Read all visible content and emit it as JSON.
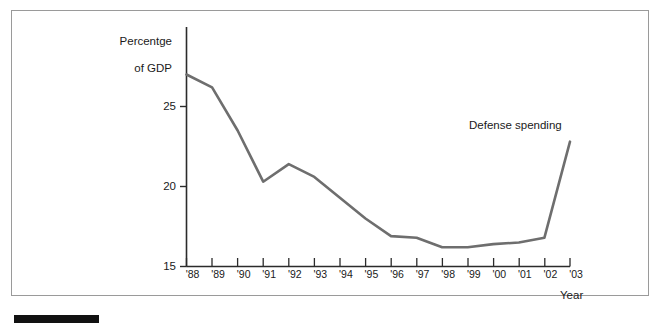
{
  "figure": {
    "background_color": "#ffffff",
    "frame_color": "#9a9a9a",
    "caption_bar_color": "#111111",
    "line_color": "#6e6e6e",
    "axis_color": "#2b2b2b"
  },
  "chart_data": {
    "type": "line",
    "title": "",
    "subtitle": "",
    "xlabel": "Year",
    "ylabel": "Percentge\nof GDP",
    "ylabel_line1": "Percentge",
    "ylabel_line2": "of GDP",
    "categories": [
      "'88",
      "'89",
      "'90",
      "'91",
      "'92",
      "'93",
      "'94",
      "'95",
      "'96",
      "'97",
      "'98",
      "'99",
      "'00",
      "'01",
      "'02",
      "'03"
    ],
    "x": [
      1988,
      1989,
      1990,
      1991,
      1992,
      1993,
      1994,
      1995,
      1996,
      1997,
      1998,
      1999,
      2000,
      2001,
      2002,
      2003
    ],
    "series": [
      {
        "name": "Defense spending",
        "values": [
          27.0,
          26.2,
          23.5,
          20.3,
          21.4,
          20.6,
          19.3,
          18.0,
          16.9,
          16.8,
          16.2,
          16.2,
          16.4,
          16.5,
          16.8,
          22.8
        ]
      }
    ],
    "ylim": [
      15,
      28.5
    ],
    "xlim": [
      1988,
      2003
    ],
    "yticks": [
      15,
      20,
      25
    ],
    "ytick_labels": [
      "15",
      "20",
      "25"
    ],
    "grid": false,
    "legend_position": "inline-annotation",
    "annotations": [
      {
        "text": "Defense spending",
        "x": 2001.1,
        "y": 23.6
      }
    ]
  }
}
